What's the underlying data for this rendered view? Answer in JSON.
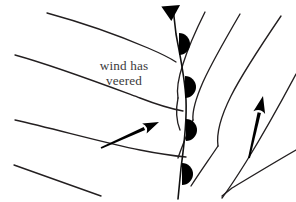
{
  "figure": {
    "background_color": "#ffffff",
    "line_color": "#231f20",
    "symbol_color": "#000000",
    "text_color": "#3b3a3c",
    "width": 296,
    "height": 202
  },
  "annotation": {
    "line1": "wind has",
    "line2": "veered",
    "x1": 124,
    "y1": 70,
    "x2": 124,
    "y2": 85
  },
  "chart_data": {
    "type": "diagram",
    "title": "wind has veered",
    "subtitle": "",
    "xlabel": "",
    "ylabel": "",
    "legend": [],
    "annotations": [
      {
        "text": "wind has veered",
        "x": 124,
        "y": 77
      }
    ],
    "front": {
      "name": "occluded-front",
      "path": "M 173 8 L 176 34 C 180 56 185 78 186 100 C 187 122 184 146 181 168 L 178 199",
      "symbols": [
        {
          "type": "cold-front-triangle",
          "cx": 172,
          "cy": 13,
          "size": 13,
          "direction": "right"
        },
        {
          "type": "warm-front-semicircle",
          "cx": 179,
          "cy": 44,
          "r": 11,
          "direction": "right"
        },
        {
          "type": "warm-front-semicircle",
          "cx": 185,
          "cy": 87,
          "r": 11,
          "direction": "right"
        },
        {
          "type": "warm-front-semicircle",
          "cx": 186,
          "cy": 130,
          "r": 11,
          "direction": "right"
        },
        {
          "type": "warm-front-semicircle",
          "cx": 182,
          "cy": 174,
          "r": 11,
          "direction": "right"
        }
      ]
    },
    "isobars_left": [
      {
        "id": "isobar-left-1",
        "path": "M 47 13 C 80 22 120 36 148 48 C 162 54 170 58 176 62"
      },
      {
        "id": "isobar-left-2",
        "path": "M 15 55 C 55 66 105 85 140 98 C 158 105 172 109 183 111"
      },
      {
        "id": "isobar-left-3",
        "path": "M 15 120 C 55 129 105 143 140 150 C 160 154 175 156 186 157"
      },
      {
        "id": "isobar-left-4",
        "path": "M 14 165 C 45 176 75 187 101 196"
      }
    ],
    "isobars_right": [
      {
        "id": "isobar-right-1",
        "path": "M 205 12 C 196 30 188 48 183 64 C 179 76 176 88 178 98"
      },
      {
        "id": "isobar-right-2",
        "path": "M 240 14 C 226 38 212 62 203 82 C 196 98 192 110 193 120"
      },
      {
        "id": "isobar-right-3",
        "path": "M 281 16 C 262 44 243 72 231 96 C 221 116 216 132 218 146"
      },
      {
        "id": "isobar-right-4",
        "path": "M 296 74 C 280 104 262 136 246 162 C 236 178 228 190 222 198"
      }
    ],
    "isobars_right_inner": [
      {
        "id": "isobar-inner-1",
        "path": "M 178 98 C 176 108 176 120 180 130"
      },
      {
        "id": "isobar-inner-2",
        "path": "M 193 120 C 188 132 182 146 178 158"
      },
      {
        "id": "isobar-inner-3",
        "path": "M 218 146 C 210 158 200 172 191 186"
      }
    ],
    "bottom_segment": {
      "id": "isobar-bottom-right",
      "path": "M 296 150 C 275 162 252 176 232 188 L 222 196"
    },
    "wind_arrows": [
      {
        "id": "wind-arrow-left",
        "label": "surface wind before front",
        "x1": 101,
        "y1": 148,
        "x2": 159,
        "y2": 122,
        "angle_deg": 24,
        "head_length": 16,
        "head_width": 11,
        "shaft_width": 3.4
      },
      {
        "id": "wind-arrow-right",
        "label": "surface wind after front",
        "x1": 249,
        "y1": 158,
        "x2": 263,
        "y2": 96,
        "angle_deg": 77,
        "head_length": 17,
        "head_width": 12,
        "shaft_width": 3.4
      }
    ]
  }
}
